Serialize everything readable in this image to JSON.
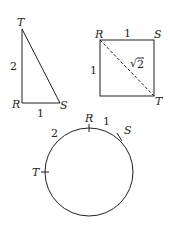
{
  "triangle": {
    "vertices": {
      "top": "T",
      "corner": "R",
      "right": "S"
    },
    "side_RT": "2",
    "side_RS": "1"
  },
  "square": {
    "vertices": {
      "top_left": "R",
      "top_right": "S",
      "bottom_right": "T"
    },
    "side_top": "1",
    "side_left": "1",
    "diagonal": "2",
    "diagonal_prefix": "√"
  },
  "circle": {
    "points": {
      "R": "R",
      "S": "S",
      "T": "T"
    },
    "arc_RS": "1",
    "arc_TR": "2"
  },
  "colors": {
    "ink": "#231f20",
    "background": "#ffffff"
  }
}
